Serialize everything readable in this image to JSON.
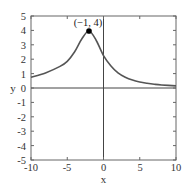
{
  "chart_data": {
    "type": "line",
    "title": "",
    "xlabel": "x",
    "ylabel": "y",
    "xlim": [
      -10,
      10
    ],
    "ylim": [
      -5,
      5
    ],
    "xticks": [
      -10,
      -5,
      0,
      5,
      10
    ],
    "yticks": [
      5,
      4,
      3,
      2,
      1,
      0,
      -1,
      -2,
      -3,
      -4,
      -5
    ],
    "xtick_labels": [
      "-10",
      "-5",
      "0",
      "5",
      "10"
    ],
    "ytick_labels": [
      "5",
      "4",
      "3",
      "2",
      "1",
      "0",
      "-1",
      "-2",
      "-3",
      "-4",
      "-5"
    ],
    "grid": false,
    "legend": null,
    "series": [
      {
        "name": "curve",
        "color": "#555555",
        "x": [
          -10,
          -8,
          -6,
          -5,
          -4,
          -3,
          -2,
          -1,
          0,
          1,
          2,
          3,
          4,
          5,
          6,
          7,
          8,
          10
        ],
        "y": [
          0.75,
          1.05,
          1.5,
          1.85,
          2.5,
          3.4,
          3.96,
          3.3,
          2.25,
          1.55,
          1.05,
          0.75,
          0.55,
          0.42,
          0.33,
          0.26,
          0.21,
          0.15
        ]
      }
    ],
    "annotations": [
      {
        "text": "(−1, 4)",
        "point": [
          -2,
          3.96
        ],
        "marker": "filled-circle"
      }
    ],
    "axes_lines": {
      "x_zero": true,
      "y_zero": true
    }
  },
  "labels": {
    "xlabel": "x",
    "ylabel": "y",
    "peak": "(−1, 4)",
    "xt0": "-10",
    "xt1": "-5",
    "xt2": "0",
    "xt3": "5",
    "xt4": "10",
    "yt0": "5",
    "yt1": "4",
    "yt2": "3",
    "yt3": "2",
    "yt4": "1",
    "yt5": "0",
    "yt6": "-1",
    "yt7": "-2",
    "yt8": "-3",
    "yt9": "-4",
    "yt10": "-5"
  }
}
